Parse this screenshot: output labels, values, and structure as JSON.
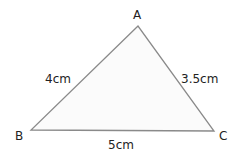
{
  "diagram": {
    "type": "triangle",
    "colors": {
      "fill": "#fbfbfb",
      "stroke": "#8a8a8a",
      "text": "#222222"
    },
    "vertices": [
      {
        "label": "A",
        "x": 138,
        "y": 26
      },
      {
        "label": "B",
        "x": 31,
        "y": 130
      },
      {
        "label": "C",
        "x": 214,
        "y": 131
      }
    ],
    "sides": [
      {
        "between": "AB",
        "length": "4cm"
      },
      {
        "between": "AC",
        "length": "3.5cm"
      },
      {
        "between": "BC",
        "length": "5cm"
      }
    ]
  }
}
